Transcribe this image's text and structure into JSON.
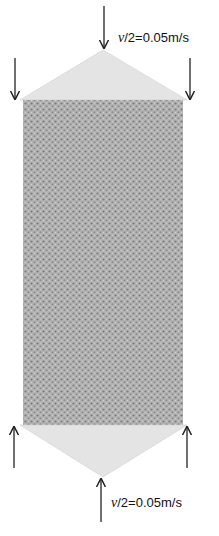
{
  "diagram": {
    "top_loading": {
      "label_symbol": "v",
      "label_rest": "/2=0.05m/s",
      "direction": "down"
    },
    "bottom_loading": {
      "label_symbol": "v",
      "label_rest": "/2=0.05m/s",
      "direction": "up"
    },
    "colors": {
      "specimen_fill": "#a8a8a8",
      "platen_fill": "#e4e4e4",
      "arrow": "#222222",
      "background": "#ffffff"
    }
  }
}
